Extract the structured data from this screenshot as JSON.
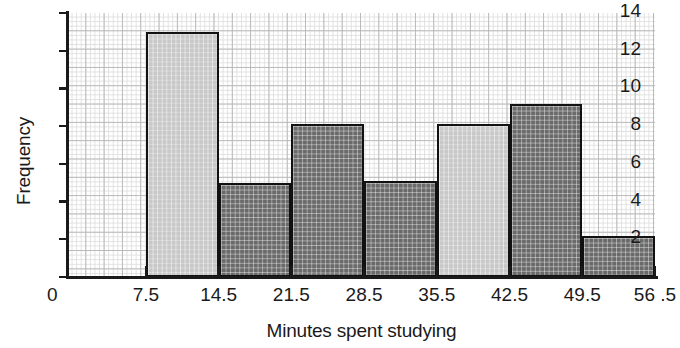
{
  "chart_data": {
    "type": "bar",
    "subtype": "histogram",
    "title": "",
    "xlabel": "Minutes spent studying",
    "ylabel": "Frequency",
    "bin_edges": [
      7.5,
      14.5,
      21.5,
      28.5,
      35.5,
      42.5,
      49.5,
      56.5
    ],
    "bin_width": 7,
    "categories": [
      "7.5-14.5",
      "14.5-21.5",
      "21.5-28.5",
      "28.5-35.5",
      "35.5-42.5",
      "42.5-49.5",
      "49.5-56.5"
    ],
    "values": [
      13,
      5,
      8.1,
      5.1,
      8.1,
      9.2,
      2.2
    ],
    "bar_shades": [
      "light",
      "dark",
      "dark",
      "dark",
      "light",
      "dark",
      "dark"
    ],
    "xlim": [
      0,
      56.5
    ],
    "ylim": [
      0,
      14
    ],
    "x_tick_labels": [
      "7.5",
      "14.5",
      "21.5",
      "28.5",
      "35.5",
      "42.5",
      "49.5",
      "56 .5"
    ],
    "x_origin_label": "0",
    "y_tick_labels": [
      "0",
      "2",
      "4",
      "6",
      "8",
      "10",
      "12",
      "14"
    ],
    "y_tick_values": [
      0,
      2,
      4,
      6,
      8,
      10,
      12,
      14
    ],
    "grid": "graph-paper",
    "legend": "none",
    "colors": {
      "bar_light": "#c8c8c8",
      "bar_dark": "#6a6a6a",
      "bar_border": "#111111",
      "axis": "#1a1a1a",
      "grid_minor": "#e0e0e0",
      "grid_major": "#b9b9b9",
      "background": "#ffffff"
    }
  }
}
